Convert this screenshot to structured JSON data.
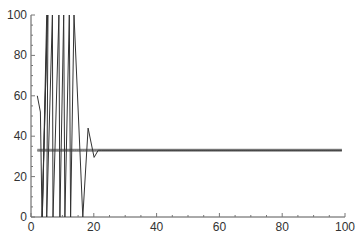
{
  "chart_data": {
    "type": "line",
    "title": "",
    "xlabel": "",
    "ylabel": "",
    "xlim": [
      0,
      100
    ],
    "ylim": [
      0,
      100
    ],
    "grid": false,
    "legend": null,
    "x_ticks": [
      0,
      20,
      40,
      60,
      80,
      100
    ],
    "y_ticks": [
      0,
      20,
      40,
      60,
      80,
      100
    ],
    "x_tick_labels": [
      "0",
      "20",
      "40",
      "60",
      "80",
      "100"
    ],
    "y_tick_labels": [
      "0",
      "20",
      "40",
      "60",
      "80",
      "100"
    ],
    "minor_tick_step": 5,
    "series": [
      {
        "name": "oscillating-response",
        "color": "#333333",
        "width": 1,
        "points": [
          [
            2,
            60
          ],
          [
            3,
            52
          ],
          [
            3.5,
            0
          ],
          [
            5.3,
            100
          ],
          [
            5.1,
            100
          ],
          [
            5.0,
            100
          ],
          [
            3.6,
            0
          ],
          [
            5.2,
            100
          ],
          [
            5.4,
            100
          ],
          [
            5.0,
            0
          ],
          [
            6.8,
            100
          ],
          [
            7.0,
            0
          ],
          [
            8.9,
            100
          ],
          [
            9.2,
            0
          ],
          [
            10.4,
            100
          ],
          [
            10.8,
            0
          ],
          [
            12.2,
            100
          ],
          [
            12.6,
            0
          ],
          [
            13.7,
            100
          ],
          [
            16.5,
            0
          ],
          [
            18.2,
            44
          ],
          [
            20.1,
            29.5
          ],
          [
            21.4,
            33
          ],
          [
            22.5,
            33
          ],
          [
            99,
            33
          ]
        ]
      },
      {
        "name": "steady-state-level",
        "color": "#8a8a8a",
        "width": 3,
        "points": [
          [
            2,
            33
          ],
          [
            99,
            33
          ]
        ]
      }
    ]
  }
}
